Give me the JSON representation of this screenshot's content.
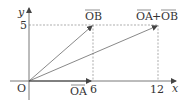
{
  "diagram": {
    "title": "",
    "axes": {
      "x_label": "x",
      "y_label": "y",
      "origin_label": "O",
      "x_ticks": [
        "6",
        "12"
      ],
      "y_ticks": [
        "5"
      ]
    },
    "vectors": [
      {
        "name": "OA",
        "label": "OA",
        "from": [
          0,
          0
        ],
        "to": [
          6,
          0
        ]
      },
      {
        "name": "OB",
        "label": "OB",
        "from": [
          0,
          0
        ],
        "to": [
          6,
          5
        ]
      },
      {
        "name": "OA+OB",
        "label_a": "OA",
        "plus": "+",
        "label_b": "OB",
        "from": [
          0,
          0
        ],
        "to": [
          12,
          5
        ]
      }
    ],
    "guides": "dashed lines at x=6, x=12, y=5",
    "colors": {
      "line": "#555555",
      "text": "#333333"
    }
  }
}
